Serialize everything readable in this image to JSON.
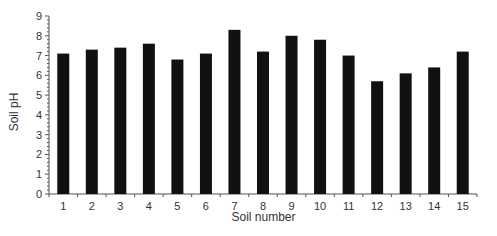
{
  "chart_data": {
    "type": "bar",
    "title": "",
    "xlabel": "Soil number",
    "ylabel": "Soil pH",
    "categories": [
      "1",
      "2",
      "3",
      "4",
      "5",
      "6",
      "7",
      "8",
      "9",
      "10",
      "11",
      "12",
      "13",
      "14",
      "15"
    ],
    "values": [
      7.1,
      7.3,
      7.4,
      7.6,
      6.8,
      7.1,
      8.3,
      7.2,
      8.0,
      7.8,
      7.0,
      5.7,
      6.1,
      6.4,
      7.2
    ],
    "ylim": [
      0,
      9
    ],
    "yticks": [
      0,
      1,
      2,
      3,
      4,
      5,
      6,
      7,
      8,
      9
    ],
    "grid": false,
    "legend": null,
    "bar_color": "#111111"
  }
}
